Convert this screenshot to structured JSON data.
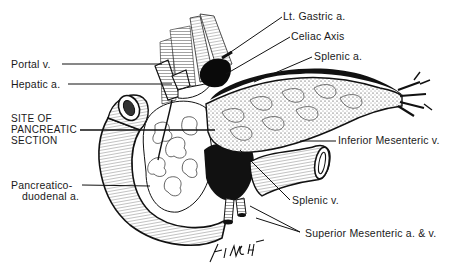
{
  "figure": {
    "signature": "FINCH '86"
  },
  "labels": {
    "left": {
      "portal_v": "Portal v.",
      "hepatic_a": "Hepatic a.",
      "site_1": "SITE OF",
      "site_2": "PANCREATIC",
      "site_3": "SECTION",
      "pd_1": "Pancreatico-",
      "pd_2": "duodenal a."
    },
    "right": {
      "lt_gastric_a": "Lt. Gastric a.",
      "celiac_axis": "Celiac Axis",
      "splenic_a": "Splenic a.",
      "inferior_mesenteric_v": "Inferior Mesenteric v.",
      "splenic_v": "Splenic v.",
      "superior_mesenteric": "Superior Mesenteric a. & v."
    }
  },
  "colors": {
    "ink": "#1a1a1a",
    "paper": "#ffffff"
  }
}
